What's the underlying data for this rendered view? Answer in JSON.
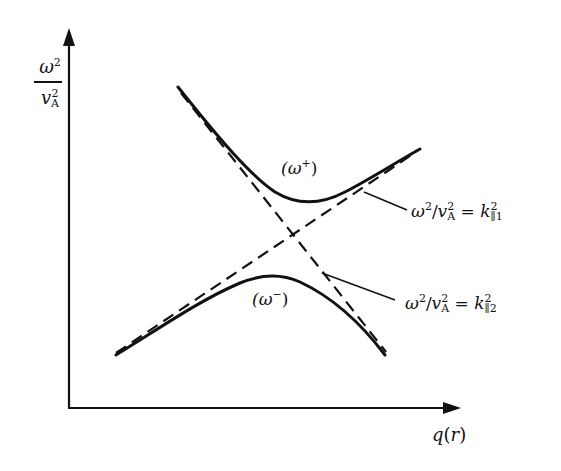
{
  "diagram": {
    "type": "avoided-crossing dispersion diagram",
    "y_axis": {
      "label_numerator": "ω",
      "label_numerator_sup": "2",
      "label_denominator": "v",
      "label_denominator_sup": "2",
      "label_denominator_sub": "A"
    },
    "x_axis": {
      "label_func": "q",
      "label_arg": "(r)"
    },
    "branches": {
      "upper": {
        "label_open": "(ω",
        "label_sup": "+",
        "label_close": ")"
      },
      "lower": {
        "label_open": "(ω",
        "label_sup": "−",
        "label_close": ")"
      }
    },
    "asymptotes": {
      "k1": {
        "lhs": "ω",
        "lhs_sup": "2",
        "slash": "/",
        "v": "v",
        "v_sup": "2",
        "v_sub": "A",
        "equals": " = ",
        "rhs": "k",
        "rhs_sup": "2",
        "rhs_sub": "∥1"
      },
      "k2": {
        "lhs": "ω",
        "lhs_sup": "2",
        "slash": "/",
        "v": "v",
        "v_sup": "2",
        "v_sub": "A",
        "equals": " = ",
        "rhs": "k",
        "rhs_sup": "2",
        "rhs_sub": "∥2"
      }
    },
    "colors": {
      "ink": "#111111",
      "background": "#ffffff"
    }
  }
}
